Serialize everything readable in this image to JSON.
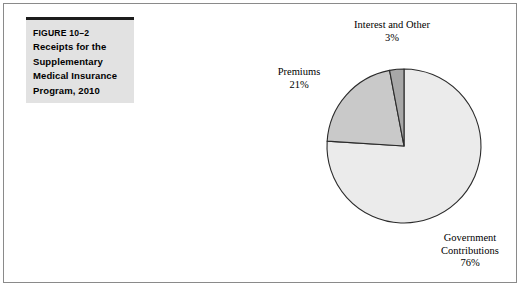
{
  "figure": {
    "number": "FIGURE 10–2",
    "title_lines": [
      "Receipts for the",
      "Supplementary",
      "Medical Insurance",
      "Program, 2010"
    ],
    "title_full": "Receipts for the Supplementary Medical Insurance Program, 2010"
  },
  "labels": {
    "interest": {
      "name": "Interest and Other",
      "percent": "3%"
    },
    "premiums": {
      "name": "Premiums",
      "percent": "21%"
    },
    "government": {
      "name_line1": "Government",
      "name_line2": "Contributions",
      "percent": "76%"
    }
  },
  "colors": {
    "government_slice": "#ebebeb",
    "premiums_slice": "#c9c9c9",
    "interest_slice": "#a8a8a8",
    "slice_outline": "#2b2b2b",
    "title_box": "#e2e2e2",
    "title_rule": "#1c1c1c",
    "frame_border": "#8a8a8a",
    "background": "#ffffff"
  },
  "chart_data": {
    "type": "pie",
    "title": "Receipts for the Supplementary Medical Insurance Program, 2010",
    "categories": [
      "Government Contributions",
      "Premiums",
      "Interest and Other"
    ],
    "values": [
      76,
      21,
      3
    ],
    "unit": "percent",
    "labels": [
      "76%",
      "21%",
      "3%"
    ],
    "colors": [
      "#ebebeb",
      "#c9c9c9",
      "#a8a8a8"
    ],
    "start_angle_deg": 0,
    "direction": "clockwise",
    "legend": "none",
    "annotations": [
      "Interest and Other 3%",
      "Premiums 21%",
      "Government Contributions 76%"
    ],
    "xlabel": "",
    "ylabel": ""
  },
  "geometry": {
    "center_x": 404,
    "center_y": 146,
    "radius": 77
  }
}
